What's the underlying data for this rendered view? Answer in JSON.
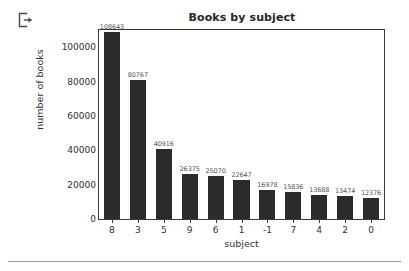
{
  "toolbar": {
    "exit_icon": "exit-icon"
  },
  "chart_data": {
    "type": "bar",
    "title": "Books by subject",
    "xlabel": "subject",
    "ylabel": "number of books",
    "categories": [
      "8",
      "3",
      "5",
      "9",
      "6",
      "1",
      "-1",
      "7",
      "4",
      "2",
      "0"
    ],
    "values": [
      108643,
      80767,
      40916,
      26375,
      25070,
      22647,
      16978,
      15836,
      13688,
      13474,
      12376
    ],
    "value_labels": [
      "108643",
      "80767",
      "40916",
      "26375",
      "25070",
      "22647",
      "16978",
      "15836",
      "13688",
      "13474",
      "12376"
    ],
    "ylim": [
      0,
      110000
    ],
    "yticks": [
      0,
      20000,
      40000,
      60000,
      80000,
      100000
    ],
    "ytick_labels": [
      "0",
      "20000",
      "40000",
      "60000",
      "80000",
      "100000"
    ],
    "grid": false,
    "legend": false,
    "bar_color": "#2b2b2b",
    "label_color": "#555555",
    "axis_color": "#3a3a3a",
    "background": "#ffffff"
  }
}
